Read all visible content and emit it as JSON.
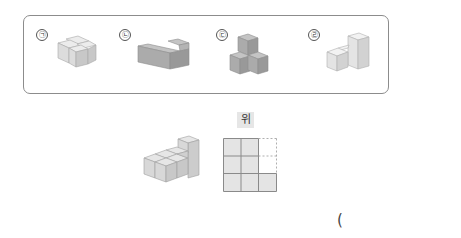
{
  "choices": [
    {
      "label": "㉠",
      "name": "giyeok"
    },
    {
      "label": "㉡",
      "name": "nieun"
    },
    {
      "label": "㉢",
      "name": "digeut"
    },
    {
      "label": "㉣",
      "name": "rieul"
    }
  ],
  "top_view": {
    "label": "위",
    "grid": [
      [
        "filled",
        "filled",
        "dashed"
      ],
      [
        "filled",
        "filled",
        "dashed"
      ],
      [
        "filled",
        "filled",
        "filled"
      ]
    ]
  },
  "answer": {
    "open_paren": "("
  },
  "colors": {
    "light_top": "#ececec",
    "light_front": "#dcdcdc",
    "light_side": "#c8c8c8",
    "dark_top": "#c4c4c4",
    "dark_front": "#ababab",
    "dark_side": "#999999",
    "grid_fill": "#e4e4e4",
    "grid_line": "#8a8a8a"
  }
}
